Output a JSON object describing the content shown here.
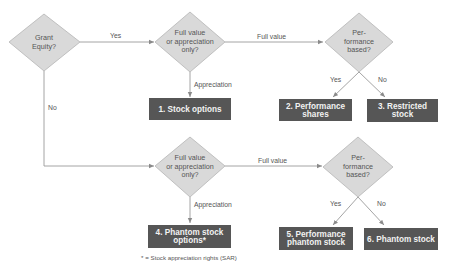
{
  "colors": {
    "diamond_fill": "#d9d9d9",
    "diamond_stroke": "#b5b5b5",
    "box_fill": "#565656",
    "box_text": "#f2f2f2",
    "line": "#9a9a9a",
    "text": "#555555"
  },
  "decisions": [
    {
      "id": "grant-equity",
      "lines": [
        "Grant",
        "Equity?"
      ]
    },
    {
      "id": "full-or-appreciation-1",
      "lines": [
        "Full value",
        "or appreciation",
        "only?"
      ]
    },
    {
      "id": "performance-based-1",
      "lines": [
        "Per-",
        "formance",
        "based?"
      ]
    },
    {
      "id": "full-or-appreciation-2",
      "lines": [
        "Full value",
        "or appreciation",
        "only?"
      ]
    },
    {
      "id": "performance-based-2",
      "lines": [
        "Per-",
        "formance",
        "based?"
      ]
    }
  ],
  "outcomes": [
    {
      "id": "stock-options",
      "lines": [
        "1. Stock options"
      ]
    },
    {
      "id": "performance-shares",
      "lines": [
        "2. Performance",
        "shares"
      ]
    },
    {
      "id": "restricted-stock",
      "lines": [
        "3. Restricted",
        "stock"
      ]
    },
    {
      "id": "phantom-stock-options",
      "lines": [
        "4. Phantom stock",
        "options*"
      ]
    },
    {
      "id": "performance-phantom-stock",
      "lines": [
        "5. Performance",
        "phantom stock"
      ]
    },
    {
      "id": "phantom-stock",
      "lines": [
        "6. Phantom stock"
      ]
    }
  ],
  "edge_labels": {
    "yes_top": "Yes",
    "no_left": "No",
    "full_value_top": "Full value",
    "appreciation_top": "Appreciation",
    "yes_perf_top": "Yes",
    "no_perf_top": "No",
    "full_value_bottom": "Full value",
    "appreciation_bottom": "Appreciation",
    "yes_perf_bottom": "Yes",
    "no_perf_bottom": "No"
  },
  "footnote": "* = Stock appreciation rights (SAR)"
}
